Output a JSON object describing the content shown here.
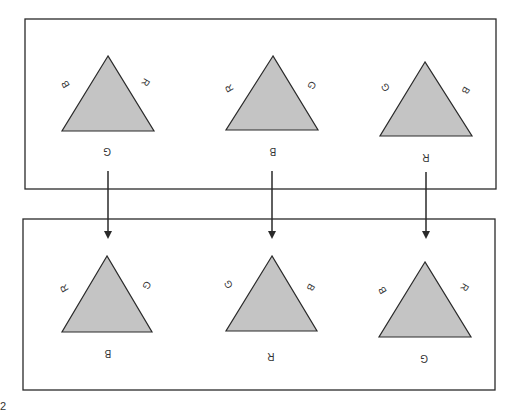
{
  "diagram": {
    "colors": {
      "triangle_fill": "#c4c4c4",
      "stroke": "#2a2a2a",
      "background": "#ffffff"
    },
    "top_row": {
      "triangles": [
        {
          "left": "B",
          "right": "R",
          "bottom": "G"
        },
        {
          "left": "R",
          "right": "G",
          "bottom": "B"
        },
        {
          "left": "G",
          "right": "B",
          "bottom": "R"
        }
      ]
    },
    "bottom_row": {
      "triangles": [
        {
          "left": "R",
          "right": "G",
          "bottom": "B"
        },
        {
          "left": "G",
          "right": "B",
          "bottom": "R"
        },
        {
          "left": "B",
          "right": "R",
          "bottom": "G"
        }
      ]
    },
    "arrows": [
      {
        "from": "top_row.0",
        "to": "bottom_row.0"
      },
      {
        "from": "top_row.1",
        "to": "bottom_row.1"
      },
      {
        "from": "top_row.2",
        "to": "bottom_row.2"
      }
    ],
    "corner_mark": "2"
  }
}
